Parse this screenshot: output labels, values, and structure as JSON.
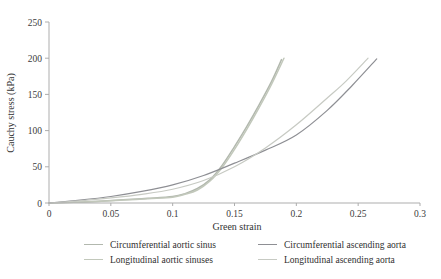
{
  "chart_data": {
    "type": "line",
    "title": "",
    "xlabel": "Green strain",
    "ylabel": "Cauchy stress (kPa)",
    "xlim": [
      0,
      0.3
    ],
    "ylim": [
      0,
      250
    ],
    "grid": false,
    "legend_position": "bottom",
    "x_ticks": [
      "0",
      "0.05",
      "0.1",
      "0.15",
      "0.2",
      "0.25",
      "0.3"
    ],
    "y_ticks": [
      "0",
      "50",
      "100",
      "150",
      "200",
      "250"
    ],
    "axis_color": "#adadad",
    "series": [
      {
        "name": "Circumferential aortic sinus",
        "color": "#b2b8ae",
        "width": 1.5,
        "points": [
          [
            0,
            0
          ],
          [
            0.02,
            1
          ],
          [
            0.04,
            2.5
          ],
          [
            0.06,
            4.5
          ],
          [
            0.08,
            6.5
          ],
          [
            0.1,
            9
          ],
          [
            0.11,
            13
          ],
          [
            0.12,
            20
          ],
          [
            0.13,
            32
          ],
          [
            0.14,
            52
          ],
          [
            0.15,
            78
          ],
          [
            0.16,
            106
          ],
          [
            0.17,
            136
          ],
          [
            0.18,
            168
          ],
          [
            0.188,
            198
          ]
        ]
      },
      {
        "name": "Longitudinal aortic sinuses",
        "color": "#c2c8bb",
        "width": 1.5,
        "points": [
          [
            0,
            0
          ],
          [
            0.02,
            1
          ],
          [
            0.04,
            2
          ],
          [
            0.06,
            4
          ],
          [
            0.08,
            6
          ],
          [
            0.1,
            8
          ],
          [
            0.11,
            12
          ],
          [
            0.12,
            18
          ],
          [
            0.13,
            30
          ],
          [
            0.14,
            49
          ],
          [
            0.15,
            74
          ],
          [
            0.16,
            102
          ],
          [
            0.17,
            132
          ],
          [
            0.18,
            164
          ],
          [
            0.19,
            200
          ]
        ]
      },
      {
        "name": "Circumferential ascending aorta",
        "color": "#8e8f94",
        "width": 1.2,
        "points": [
          [
            0,
            0
          ],
          [
            0.025,
            4
          ],
          [
            0.05,
            9
          ],
          [
            0.075,
            16
          ],
          [
            0.1,
            25
          ],
          [
            0.125,
            38
          ],
          [
            0.15,
            55
          ],
          [
            0.175,
            73
          ],
          [
            0.2,
            94
          ],
          [
            0.225,
            128
          ],
          [
            0.245,
            162
          ],
          [
            0.265,
            199
          ]
        ]
      },
      {
        "name": "Longitudinal ascending aorta",
        "color": "#c7cac3",
        "width": 1.2,
        "points": [
          [
            0,
            0
          ],
          [
            0.025,
            3
          ],
          [
            0.05,
            7
          ],
          [
            0.075,
            12
          ],
          [
            0.1,
            19
          ],
          [
            0.125,
            31
          ],
          [
            0.15,
            50
          ],
          [
            0.175,
            76
          ],
          [
            0.2,
            108
          ],
          [
            0.225,
            145
          ],
          [
            0.24,
            168
          ],
          [
            0.258,
            200
          ]
        ]
      }
    ]
  }
}
